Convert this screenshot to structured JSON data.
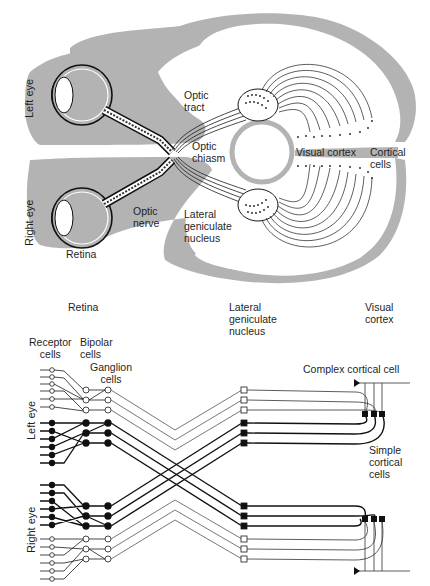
{
  "top_diagram": {
    "labels": {
      "left_eye": "Left eye",
      "right_eye": "Right eye",
      "optic_tract": "Optic\ntract",
      "optic_chiasm": "Optic\nchiasm",
      "optic_nerve": "Optic\nnerve",
      "lateral_geniculate_nucleus": "Lateral\ngeniculate\nnucleus",
      "retina": "Retina",
      "visual_cortex": "Visual cortex",
      "cortical_cells": "Cortical\ncells"
    },
    "colors": {
      "gray_matter": "#b3b3b3",
      "line": "#1a1a1a"
    }
  },
  "bottom_diagram": {
    "column_headers": {
      "retina": "Retina",
      "lgn": "Lateral\ngeniculate\nnucleus",
      "visual_cortex": "Visual\ncortex"
    },
    "labels": {
      "receptor_cells": "Receptor\ncells",
      "bipolar_cells": "Bipolar\ncells",
      "ganglion_cells": "Ganglion\ncells",
      "complex_cortical_cell": "Complex cortical cell",
      "simple_cortical_cells": "Simple\ncortical\ncells",
      "left_eye": "Left eye",
      "right_eye": "Right eye"
    }
  }
}
